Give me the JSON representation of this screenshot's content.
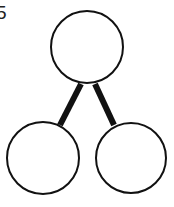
{
  "label": "5",
  "diagram": {
    "type": "number-bond",
    "nodes": [
      {
        "id": "whole",
        "value": ""
      },
      {
        "id": "part-left",
        "value": ""
      },
      {
        "id": "part-right",
        "value": ""
      }
    ],
    "edges": [
      [
        "whole",
        "part-left"
      ],
      [
        "whole",
        "part-right"
      ]
    ]
  }
}
